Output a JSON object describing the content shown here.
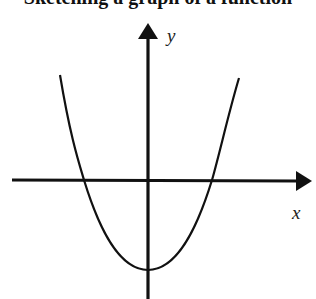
{
  "title": "Sketching a graph of a function",
  "diagram": {
    "type": "parabola-on-axes",
    "axes": {
      "x_label": "x",
      "y_label": "y"
    },
    "curve": {
      "shape": "upward-opening parabola",
      "x_intercepts": 2,
      "vertex": "below x-axis on y-axis"
    },
    "colors": {
      "stroke": "#111111",
      "background": "#ffffff"
    }
  }
}
